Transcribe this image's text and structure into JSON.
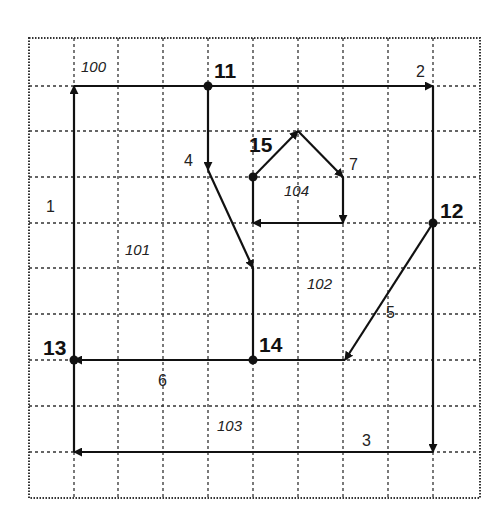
{
  "diagram": {
    "type": "planar-graph-on-grid",
    "grid": {
      "x_lines": [
        29,
        74,
        118,
        163,
        208,
        253,
        298,
        343,
        388,
        433,
        480
      ],
      "y_lines": [
        38,
        86,
        131,
        177,
        223,
        268,
        314,
        360,
        406,
        452,
        498
      ],
      "style": "dotted"
    },
    "nodes": [
      {
        "id": "11",
        "label": "11",
        "x": 208,
        "y": 86,
        "lx": 214,
        "ly": 78
      },
      {
        "id": "12",
        "label": "12",
        "x": 433,
        "y": 223,
        "lx": 440,
        "ly": 218
      },
      {
        "id": "13",
        "label": "13",
        "x": 74,
        "y": 360,
        "lx": 43,
        "ly": 355
      },
      {
        "id": "14",
        "label": "14",
        "x": 253,
        "y": 360,
        "lx": 259,
        "ly": 352
      },
      {
        "id": "15",
        "label": "15",
        "x": 253,
        "y": 177,
        "lx": 249,
        "ly": 152
      }
    ],
    "edges": [
      {
        "id": "1",
        "label": "1",
        "points": [
          [
            74,
            452
          ],
          [
            74,
            86
          ]
        ],
        "arrow_at": [
          74,
          86
        ],
        "lx": 46,
        "ly": 212
      },
      {
        "id": "2",
        "label": "2",
        "points": [
          [
            74,
            86
          ],
          [
            433,
            86
          ]
        ],
        "arrow_at": [
          433,
          86
        ],
        "lx": 416,
        "ly": 77
      },
      {
        "id": "3",
        "label": "3",
        "points": [
          [
            433,
            86
          ],
          [
            433,
            452
          ]
        ],
        "arrow_at": [
          433,
          452
        ],
        "lx": 362,
        "ly": 446
      },
      {
        "id": "3b",
        "label": "",
        "points": [
          [
            433,
            452
          ],
          [
            74,
            452
          ]
        ],
        "arrow_at": [
          74,
          452
        ],
        "lx": 0,
        "ly": 0
      },
      {
        "id": "4",
        "label": "4",
        "points": [
          [
            208,
            86
          ],
          [
            208,
            170
          ]
        ],
        "arrow_at": [
          208,
          170
        ],
        "lx": 184,
        "ly": 166
      },
      {
        "id": "4b",
        "label": "",
        "points": [
          [
            208,
            170
          ],
          [
            253,
            268
          ]
        ],
        "arrow_at": [
          253,
          268
        ],
        "lx": 0,
        "ly": 0
      },
      {
        "id": "4c",
        "label": "",
        "points": [
          [
            253,
            268
          ],
          [
            253,
            360
          ]
        ],
        "arrow_at": null,
        "lx": 0,
        "ly": 0
      },
      {
        "id": "5",
        "label": "5",
        "points": [
          [
            433,
            223
          ],
          [
            345,
            360
          ]
        ],
        "arrow_at": [
          345,
          360
        ],
        "lx": 386,
        "ly": 318
      },
      {
        "id": "5b",
        "label": "",
        "points": [
          [
            345,
            360
          ],
          [
            253,
            360
          ]
        ],
        "arrow_at": null,
        "lx": 0,
        "ly": 0
      },
      {
        "id": "6",
        "label": "6",
        "points": [
          [
            253,
            360
          ],
          [
            74,
            360
          ]
        ],
        "arrow_at": [
          77,
          360
        ],
        "lx": 158,
        "ly": 386
      },
      {
        "id": "7",
        "label": "7",
        "points": [
          [
            253,
            177
          ],
          [
            298,
            131
          ]
        ],
        "arrow_at": [
          298,
          131
        ],
        "lx": 349,
        "ly": 170
      },
      {
        "id": "7b",
        "label": "",
        "points": [
          [
            298,
            131
          ],
          [
            343,
            177
          ]
        ],
        "arrow_at": [
          343,
          177
        ],
        "lx": 0,
        "ly": 0
      },
      {
        "id": "7c",
        "label": "",
        "points": [
          [
            343,
            177
          ],
          [
            343,
            223
          ]
        ],
        "arrow_at": [
          343,
          223
        ],
        "lx": 0,
        "ly": 0
      },
      {
        "id": "7d",
        "label": "",
        "points": [
          [
            343,
            223
          ],
          [
            253,
            223
          ]
        ],
        "arrow_at": [
          253,
          223
        ],
        "lx": 0,
        "ly": 0
      },
      {
        "id": "7e",
        "label": "",
        "points": [
          [
            253,
            223
          ],
          [
            253,
            177
          ]
        ],
        "arrow_at": null,
        "lx": 0,
        "ly": 0
      }
    ],
    "faces": [
      {
        "id": "100",
        "label": "100",
        "x": 81,
        "y": 72
      },
      {
        "id": "101",
        "label": "101",
        "x": 125,
        "y": 255
      },
      {
        "id": "102",
        "label": "102",
        "x": 307,
        "y": 289
      },
      {
        "id": "103",
        "label": "103",
        "x": 217,
        "y": 431
      },
      {
        "id": "104",
        "label": "104",
        "x": 284,
        "y": 196
      }
    ]
  }
}
